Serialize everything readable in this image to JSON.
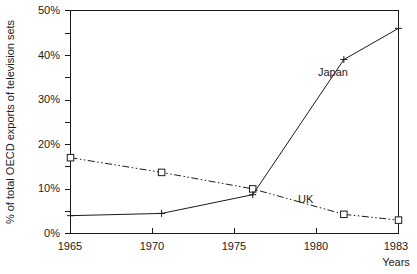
{
  "chart_data": {
    "type": "line",
    "title": "",
    "xlabel": "Years",
    "ylabel": "% of total OECD exports of television sets",
    "x": [
      1965,
      1970,
      1975,
      1980,
      1983
    ],
    "xtick_labels": [
      "1965",
      "1970",
      "1975",
      "1980",
      "1983"
    ],
    "ytick_labels": [
      "0%",
      "10%",
      "20%",
      "30%",
      "40%",
      "50%"
    ],
    "ytick_values": [
      0,
      10,
      20,
      30,
      40,
      50
    ],
    "yminor_values": [
      5,
      15,
      25,
      35,
      45
    ],
    "xlim": [
      1965,
      1983
    ],
    "ylim": [
      0,
      50
    ],
    "grid": false,
    "legend_position": "inline-annotation",
    "series": [
      {
        "name": "Japan",
        "values": [
          4.0,
          4.5,
          8.7,
          39.0,
          46.0
        ],
        "marker": "plus",
        "linestyle": "solid",
        "color": "#1a1a1a",
        "label_x": 1980,
        "label_y": 35.5
      },
      {
        "name": "UK",
        "values": [
          17.0,
          13.7,
          10.0,
          4.3,
          3.0
        ],
        "marker": "square",
        "linestyle": "dash-dot-dot",
        "color": "#1a1a1a",
        "label_x": 1979.2,
        "label_y": 8.5
      }
    ]
  },
  "axes": {
    "ylabel": "% of total OECD exports of television sets",
    "xlabel": "Years"
  },
  "colors": {
    "ink": "#1a1a1a",
    "background": "#ffffff"
  }
}
